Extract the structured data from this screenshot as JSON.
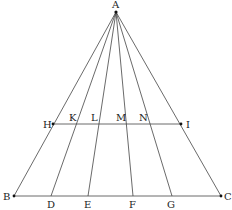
{
  "diagram": {
    "type": "geometric-figure",
    "points": {
      "A": {
        "label": "A",
        "x": 116,
        "y": 12
      },
      "B": {
        "label": "B",
        "x": 14,
        "y": 196
      },
      "C": {
        "label": "C",
        "x": 221,
        "y": 196
      },
      "D": {
        "label": "D",
        "x": 51,
        "y": 196
      },
      "E": {
        "label": "E",
        "x": 88,
        "y": 196
      },
      "F": {
        "label": "F",
        "x": 133,
        "y": 196
      },
      "G": {
        "label": "G",
        "x": 172,
        "y": 196
      },
      "H": {
        "label": "H",
        "x": 53,
        "y": 124
      },
      "I": {
        "label": "I",
        "x": 181,
        "y": 124
      },
      "K": {
        "label": "K",
        "x": 77,
        "y": 124
      },
      "L": {
        "label": "L",
        "x": 99,
        "y": 124
      },
      "M": {
        "label": "M",
        "x": 126,
        "y": 124
      },
      "N": {
        "label": "N",
        "x": 150,
        "y": 124
      }
    },
    "segments": [
      [
        "A",
        "B"
      ],
      [
        "A",
        "D"
      ],
      [
        "A",
        "E"
      ],
      [
        "A",
        "F"
      ],
      [
        "A",
        "G"
      ],
      [
        "A",
        "C"
      ],
      [
        "B",
        "C"
      ],
      [
        "H",
        "I"
      ]
    ]
  }
}
